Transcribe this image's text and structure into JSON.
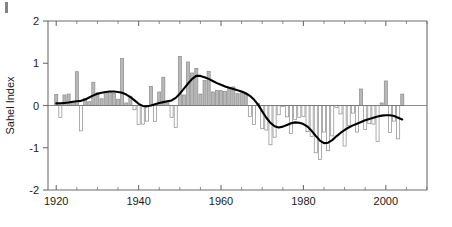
{
  "figure": {
    "corner_mark": "page-edge-artifact"
  },
  "chart_data": {
    "type": "bar",
    "title": "",
    "subtitle": "",
    "xlabel": "",
    "ylabel": "Sahel Index",
    "xlim": [
      1918,
      2010
    ],
    "ylim": [
      -2,
      2
    ],
    "xticks": [
      1920,
      1940,
      1960,
      1980,
      2000
    ],
    "xtick_labels": [
      "1920",
      "1940",
      "1960",
      "1980",
      "2000"
    ],
    "x_minor_tick_step": 5,
    "yticks": [
      -2,
      -1,
      0,
      1,
      2
    ],
    "ytick_labels": [
      "-2",
      "-1",
      "0",
      "1",
      "2"
    ],
    "grid": false,
    "legend": null,
    "zero_line": 0,
    "bar_color": "#b8b8b8",
    "bar_edge_color": "#8a8a8a",
    "line_color": "#000000",
    "axis_color": "#6e6e6e",
    "categories": [
      1920,
      1921,
      1922,
      1923,
      1924,
      1925,
      1926,
      1927,
      1928,
      1929,
      1930,
      1931,
      1932,
      1933,
      1934,
      1935,
      1936,
      1937,
      1938,
      1939,
      1940,
      1941,
      1942,
      1943,
      1944,
      1945,
      1946,
      1947,
      1948,
      1949,
      1950,
      1951,
      1952,
      1953,
      1954,
      1955,
      1956,
      1957,
      1958,
      1959,
      1960,
      1961,
      1962,
      1963,
      1964,
      1965,
      1966,
      1967,
      1968,
      1969,
      1970,
      1971,
      1972,
      1973,
      1974,
      1975,
      1976,
      1977,
      1978,
      1979,
      1980,
      1981,
      1982,
      1983,
      1984,
      1985,
      1986,
      1987,
      1988,
      1989,
      1990,
      1991,
      1992,
      1993,
      1994,
      1995,
      1996,
      1997,
      1998,
      1999,
      2000,
      2001,
      2002,
      2003,
      2004
    ],
    "series": [
      {
        "name": "Sahel Index (annual)",
        "type": "bar",
        "values": [
          0.26,
          -0.28,
          0.25,
          0.27,
          0.07,
          0.8,
          -0.6,
          0.17,
          0.09,
          0.55,
          0.3,
          0.16,
          0.32,
          0.33,
          0.29,
          0.15,
          1.11,
          0.06,
          0.22,
          -0.1,
          -0.45,
          -0.44,
          -0.37,
          0.45,
          -0.38,
          0.32,
          0.67,
          0.1,
          -0.28,
          -0.52,
          1.16,
          0.25,
          1.03,
          0.77,
          0.88,
          0.27,
          0.59,
          0.81,
          0.32,
          0.36,
          0.35,
          0.33,
          0.41,
          0.44,
          0.28,
          0.3,
          0.26,
          -0.26,
          -0.45,
          0.05,
          -0.55,
          -0.58,
          -0.93,
          -0.75,
          -0.22,
          -0.02,
          -0.27,
          -0.66,
          -0.33,
          -0.28,
          -0.26,
          -0.62,
          -0.73,
          -1.12,
          -1.28,
          -0.63,
          -1.07,
          -0.72,
          -0.05,
          -0.2,
          -0.96,
          -0.47,
          -0.18,
          -0.63,
          0.39,
          -0.57,
          -0.43,
          -0.44,
          -0.85,
          0.06,
          0.58,
          -0.64,
          -0.37,
          -0.79,
          0.27
        ]
      },
      {
        "name": "Smoothed trend",
        "type": "line",
        "values": [
          0.05,
          0.05,
          0.06,
          0.07,
          0.09,
          0.1,
          0.11,
          0.14,
          0.19,
          0.24,
          0.28,
          0.3,
          0.32,
          0.33,
          0.33,
          0.32,
          0.3,
          0.26,
          0.2,
          0.12,
          0.04,
          -0.01,
          -0.02,
          0.0,
          0.03,
          0.06,
          0.08,
          0.1,
          0.12,
          0.18,
          0.28,
          0.4,
          0.52,
          0.63,
          0.7,
          0.7,
          0.67,
          0.63,
          0.58,
          0.53,
          0.49,
          0.45,
          0.42,
          0.39,
          0.36,
          0.33,
          0.29,
          0.23,
          0.14,
          0.02,
          -0.14,
          -0.29,
          -0.41,
          -0.49,
          -0.52,
          -0.5,
          -0.46,
          -0.42,
          -0.4,
          -0.41,
          -0.44,
          -0.5,
          -0.6,
          -0.72,
          -0.83,
          -0.89,
          -0.88,
          -0.82,
          -0.73,
          -0.65,
          -0.58,
          -0.52,
          -0.47,
          -0.43,
          -0.39,
          -0.35,
          -0.32,
          -0.29,
          -0.26,
          -0.24,
          -0.23,
          -0.23,
          -0.25,
          -0.29,
          -0.33
        ]
      }
    ]
  }
}
